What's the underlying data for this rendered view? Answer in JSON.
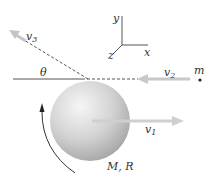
{
  "diagram": {
    "labels": {
      "v1": "v",
      "v1_sub": "1",
      "v2": "v",
      "v2_sub": "2",
      "v3": "v",
      "v3_sub": "3",
      "theta": "θ",
      "m": "m",
      "mass_radius": "M, R",
      "axis_x": "x",
      "axis_y": "y",
      "axis_z": "z"
    },
    "colors": {
      "line": "#444444",
      "arrow_gray": "#c8c8c8",
      "sphere_light": "#f2f2f2",
      "sphere_dark": "#9a9a9a",
      "text": "#333333"
    }
  }
}
